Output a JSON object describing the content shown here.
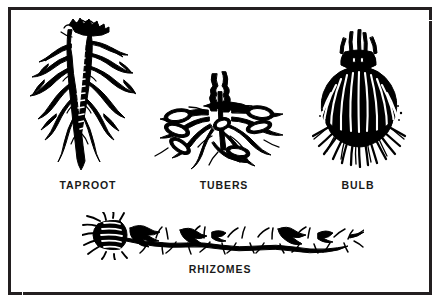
{
  "figure": {
    "background_color": "#ffffff",
    "border_color": "#231f20",
    "ink_color": "#000000",
    "style": "black-and-white line drawing / woodcut illustration"
  },
  "specimens": [
    {
      "id": "taproot",
      "label": "TAPROOT",
      "icon": "taproot-illustration",
      "position": "top-left",
      "description": "Single thick vertical main root with many lateral branching roots"
    },
    {
      "id": "tubers",
      "label": "TUBERS",
      "icon": "tubers-illustration",
      "position": "top-center",
      "description": "Cluster of swollen storage tubers radiating from a central stem base"
    },
    {
      "id": "bulb",
      "label": "BULB",
      "icon": "bulb-illustration",
      "position": "top-right",
      "description": "Rounded layered bulb with neck shoots above and fibrous root fringe below"
    },
    {
      "id": "rhizomes",
      "label": "RHIZOMES",
      "icon": "rhizomes-illustration",
      "position": "bottom-center",
      "description": "Long horizontal jointed underground stem with nodes and fine roots"
    }
  ]
}
